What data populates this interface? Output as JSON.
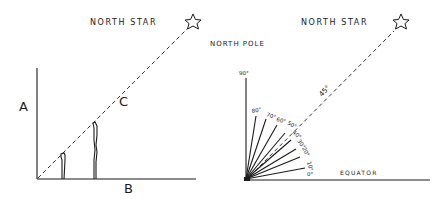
{
  "left_diagram": {
    "star_label": "NORTH STAR",
    "label_a": "A",
    "label_b": "B",
    "label_c": "C"
  },
  "right_diagram": {
    "star_label": "NORTH STAR",
    "pole_label": "NORTH POLE",
    "equator_label": "EQUATOR",
    "top_angle_label": "90°",
    "star_angle_label": "45°",
    "fan_angles": [
      {
        "deg": 80,
        "label": "80°"
      },
      {
        "deg": 70,
        "label": "70°"
      },
      {
        "deg": 60,
        "label": "60°"
      },
      {
        "deg": 50,
        "label": "50°"
      },
      {
        "deg": 40,
        "label": "40°"
      },
      {
        "deg": 30,
        "label": "30°"
      },
      {
        "deg": 20,
        "label": "20°"
      },
      {
        "deg": 10,
        "label": "10°"
      },
      {
        "deg": 0,
        "label": "0°"
      }
    ]
  },
  "colors": {
    "ink": "#1a1a1a",
    "background": "#ffffff"
  }
}
